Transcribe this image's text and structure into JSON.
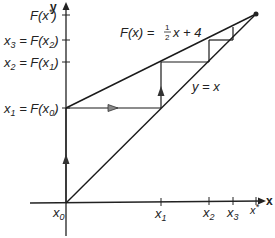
{
  "figure": {
    "function_label": {
      "text": "F(x) = ",
      "frac_num": "1",
      "frac_den": "2",
      "rest": "x + 4"
    },
    "identity_label": "y = x",
    "axes": {
      "x_name": "x",
      "y_name": "y",
      "x_ticks": [
        {
          "base": "x",
          "sub": "0"
        },
        {
          "base": "x",
          "sub": "1"
        },
        {
          "base": "x",
          "sub": "2"
        },
        {
          "base": "x",
          "sub": "3"
        },
        {
          "base": "x",
          "sup": "*"
        }
      ],
      "y_ticks": [
        {
          "text": "F(x*)"
        },
        {
          "lhs": "x",
          "lhs_sub": "3",
          "rhs": "F(x",
          "rhs_sub": "2"
        },
        {
          "lhs": "x",
          "lhs_sub": "2",
          "rhs": "F(x",
          "rhs_sub": "1"
        },
        {
          "lhs": "x",
          "lhs_sub": "1",
          "rhs": "F(x",
          "rhs_sub": "0"
        }
      ]
    },
    "colors": {
      "line": "#1a1a1a",
      "arrow": "#333333",
      "background": "#ffffff"
    }
  }
}
